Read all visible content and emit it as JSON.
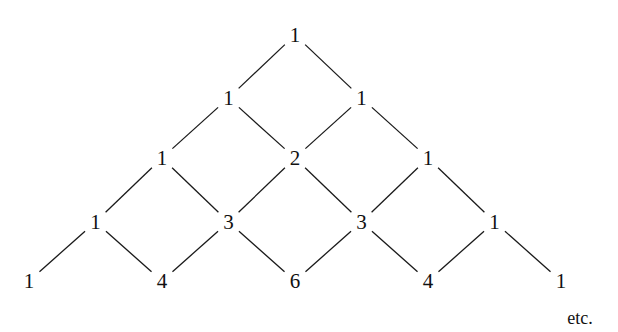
{
  "diagram": {
    "rows": [
      [
        1
      ],
      [
        1,
        1
      ],
      [
        1,
        2,
        1
      ],
      [
        1,
        3,
        3,
        1
      ],
      [
        1,
        4,
        6,
        4,
        1
      ]
    ],
    "row_y": [
      35,
      98,
      158,
      222,
      281
    ],
    "apex_x": 295,
    "col_step": 66.5,
    "continuation_label": "etc.",
    "continuation_pos": [
      580,
      318
    ],
    "line_color": "#1a1a1a",
    "text_color": "#111111"
  }
}
